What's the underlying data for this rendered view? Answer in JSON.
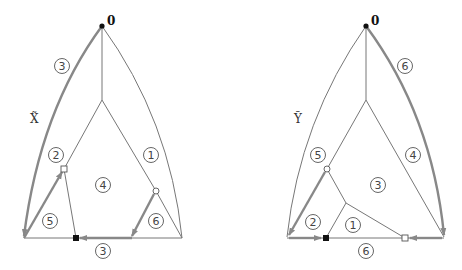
{
  "left": {
    "name": "X̃",
    "apex_label": "0",
    "regions": [
      {
        "label": "3",
        "x": 62,
        "y": 66
      },
      {
        "label": "2",
        "x": 56,
        "y": 155
      },
      {
        "label": "1",
        "x": 151,
        "y": 155
      },
      {
        "label": "4",
        "x": 103,
        "y": 185
      },
      {
        "label": "5",
        "x": 50,
        "y": 221
      },
      {
        "label": "6",
        "x": 156,
        "y": 221
      },
      {
        "label": "3",
        "x": 103,
        "y": 250
      }
    ]
  },
  "right": {
    "name": "Ỹ",
    "apex_label": "0",
    "regions": [
      {
        "label": "6",
        "x": 405,
        "y": 66
      },
      {
        "label": "5",
        "x": 318,
        "y": 155
      },
      {
        "label": "4",
        "x": 413,
        "y": 155
      },
      {
        "label": "3",
        "x": 378,
        "y": 185
      },
      {
        "label": "2",
        "x": 313,
        "y": 222
      },
      {
        "label": "1",
        "x": 353,
        "y": 225
      },
      {
        "label": "6",
        "x": 366,
        "y": 250
      }
    ]
  }
}
